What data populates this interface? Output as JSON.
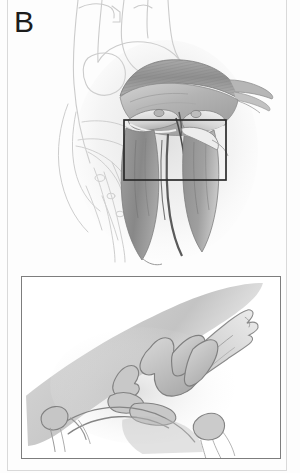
{
  "figure": {
    "panel_label": "B",
    "background_color": "#fdfdfd",
    "page_border_color": "#d9d9d9",
    "label_color": "#1c1c1c"
  },
  "main_illustration": {
    "name": "heart-cutaway-aortic-root-illustration",
    "description": "Pencil-shaded anatomical cutaway of the heart showing the aortic root, aortic valve cusps and left ventricular outflow tract with chordae; surrounding great vessels drawn as faint outline",
    "outline_color": "#cfcfcf",
    "shading_dark": "#8d8d8d",
    "shading_mid": "#b0b0b0",
    "shading_light": "#d6d6d6"
  },
  "selection_rect": {
    "name": "magnification-region-rectangle",
    "stroke_color": "#2b2b2b",
    "x": 124,
    "y": 120,
    "width": 102,
    "height": 60
  },
  "inset_panel": {
    "name": "magnified-detail-inset",
    "border_color": "#7d7d7d",
    "description": "Magnified view of the aortic valve region showing irregular nodular vegetations and an elongated flail leaflet fragment",
    "outline_color": "#8a8a8a",
    "shading_mid": "#c2c2c2",
    "shading_light": "#dedede"
  }
}
